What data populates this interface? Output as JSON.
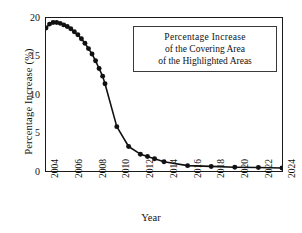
{
  "chart_data": {
    "type": "line",
    "title": "",
    "xlabel": "Year",
    "ylabel": "Percentage  Increase (%)",
    "xlim": [
      2004,
      2024
    ],
    "ylim": [
      0,
      20
    ],
    "yticks": [
      0,
      5,
      10,
      15,
      20
    ],
    "xticks": [
      2004,
      2006,
      2008,
      2010,
      2012,
      2014,
      2016,
      2018,
      2020,
      2022,
      2024
    ],
    "grid": false,
    "legend_position": "inside-top-right",
    "marker": "filled-circle",
    "line_color": "#111111",
    "marker_color": "#111111",
    "annotation_lines": [
      "Percentage  Increase",
      "of the Covering Area",
      "of the Highlighted Areas"
    ],
    "series": [
      {
        "name": "Percentage Increase of the Covering Area of the Highlighted Areas",
        "x": [
          2004.0,
          2004.3,
          2004.6,
          2004.9,
          2005.2,
          2005.5,
          2005.8,
          2006.1,
          2006.4,
          2006.7,
          2007.0,
          2007.3,
          2007.6,
          2007.9,
          2008.2,
          2008.5,
          2008.8,
          2009.0,
          2010.0,
          2011.0,
          2012.0,
          2012.6,
          2013.2,
          2014.0,
          2016.0,
          2018.0,
          2020.0,
          2022.0,
          2024.0
        ],
        "values": [
          18.7,
          19.2,
          19.4,
          19.4,
          19.3,
          19.1,
          18.9,
          18.6,
          18.2,
          17.8,
          17.3,
          16.7,
          16.0,
          15.3,
          14.4,
          13.4,
          12.4,
          11.4,
          5.8,
          3.2,
          2.2,
          1.9,
          1.6,
          1.2,
          0.7,
          0.6,
          0.5,
          0.45,
          0.4
        ]
      }
    ]
  },
  "axes": {
    "ylabel_text": "Percentage  Increase (%)",
    "xlabel_text": "Year",
    "ytick_labels": [
      "20",
      "15",
      "10",
      "5",
      "0"
    ],
    "xtick_labels": [
      "2004",
      "2006",
      "2008",
      "2010",
      "2012",
      "2014",
      "2016",
      "2018",
      "2020",
      "2022",
      "2024"
    ]
  },
  "legend": {
    "line1": "Percentage  Increase",
    "line2": "of the Covering Area",
    "line3": "of the Highlighted Areas"
  }
}
